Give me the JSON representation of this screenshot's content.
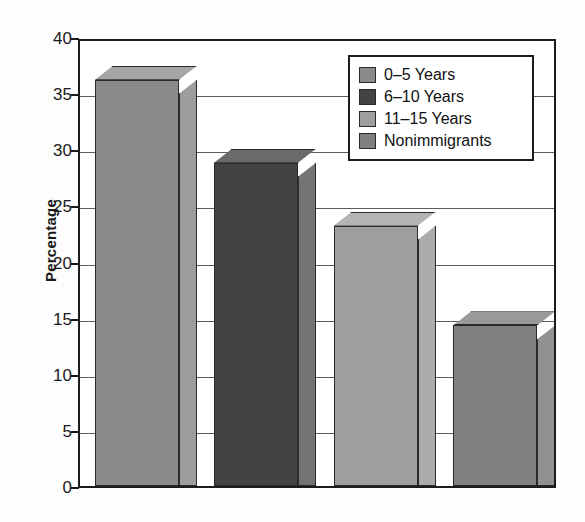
{
  "chart_data": {
    "type": "bar",
    "title": "",
    "xlabel": "",
    "ylabel": "Percentage",
    "ylim": [
      0,
      40
    ],
    "ytick_step": 5,
    "yticks": [
      40,
      35,
      30,
      25,
      20,
      15,
      10,
      5,
      0
    ],
    "grid": true,
    "grid_axis": "y",
    "legend_position": "upper-right",
    "style": "3d-extruded-bars",
    "categories": [
      "0–5 Years",
      "6–10 Years",
      "11–15 Years",
      "Nonimmigrants"
    ],
    "values": [
      36.2,
      28.8,
      23.2,
      14.3
    ],
    "series": [
      {
        "name": "Percentage",
        "values": [
          36.2,
          28.8,
          23.2,
          14.3
        ]
      }
    ],
    "bars": [
      {
        "label": "0–5 Years",
        "value": 36.2,
        "color": "#8a8a8a",
        "top_color": "#a5a5a5",
        "side_color": "#9d9d9d"
      },
      {
        "label": "6–10 Years",
        "value": 28.8,
        "color": "#434343",
        "top_color": "#6a6a6a",
        "side_color": "#747474"
      },
      {
        "label": "11–15 Years",
        "value": 23.2,
        "color": "#9e9e9e",
        "top_color": "#b4b4b4",
        "side_color": "#ababab"
      },
      {
        "label": "Nonimmigrants",
        "value": 14.3,
        "color": "#808080",
        "top_color": "#9a9a9a",
        "side_color": "#919191"
      }
    ],
    "legend": [
      {
        "label": "0–5 Years",
        "color": "#8a8a8a"
      },
      {
        "label": "6–10 Years",
        "color": "#434343"
      },
      {
        "label": "11–15 Years",
        "color": "#9e9e9e"
      },
      {
        "label": "Nonimmigrants",
        "color": "#808080"
      }
    ],
    "colors": {
      "axis": "#1c1c1c",
      "gridline": "#5c5c5c",
      "background": "#ffffff",
      "text": "#111111"
    }
  }
}
